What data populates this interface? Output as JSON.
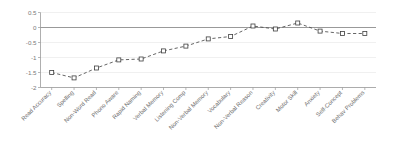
{
  "chart_data": {
    "type": "line",
    "title": "",
    "subtitle": "",
    "xlabel": "",
    "ylabel": "",
    "ylim": [
      -2,
      0.5
    ],
    "yticks": [
      0.5,
      0,
      -0.5,
      -1,
      -1.5,
      -2
    ],
    "ytick_labels": [
      "0.5",
      "0",
      "-0.5",
      "-1",
      "-1.5",
      "-2"
    ],
    "grid": true,
    "legend": "none",
    "zero_reference_line": 0,
    "marker": "open-square",
    "linestyle": "dashed",
    "categories": [
      "Read Accuracy",
      "Spelling",
      "Non-Word Read",
      "Phono Aware",
      "Rapid Naming",
      "Verbal Memory",
      "Listening Comp",
      "Non-Verbal Memory",
      "Vocabulary",
      "Non-Verbal Reason",
      "Creativity",
      "Motor Skill",
      "Anxiety",
      "Self-Concept",
      "Behav Problems"
    ],
    "values": [
      -1.5,
      -1.68,
      -1.35,
      -1.08,
      -1.05,
      -0.78,
      -0.62,
      -0.38,
      -0.3,
      0.05,
      -0.05,
      0.15,
      -0.12,
      -0.2,
      -0.2
    ],
    "series": [
      {
        "name": "Effect size",
        "values": [
          -1.5,
          -1.68,
          -1.35,
          -1.08,
          -1.05,
          -0.78,
          -0.62,
          -0.38,
          -0.3,
          0.05,
          -0.05,
          0.15,
          -0.12,
          -0.2,
          -0.2
        ]
      }
    ]
  },
  "colors": {
    "grid": "#e9e9e9",
    "zero_line": "#8d8d8d",
    "axis": "#9a9a9a",
    "series_line": "#4a4a4a",
    "marker_stroke": "#3f3f3f",
    "marker_fill": "#ffffff",
    "tick_text": "#7a7a7a",
    "category_text": "#6f6f6f",
    "background": "#ffffff"
  }
}
